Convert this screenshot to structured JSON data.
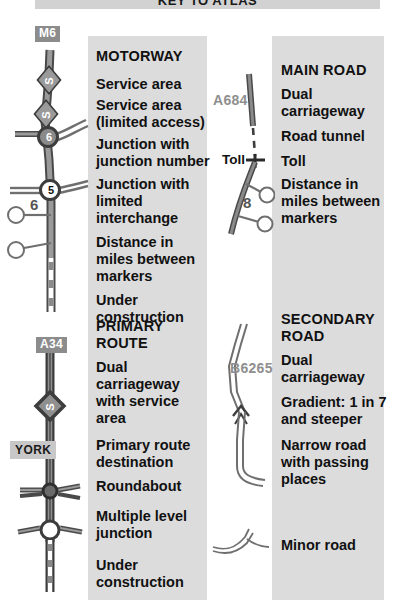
{
  "title": "KEY TO ATLAS",
  "colors": {
    "panel_bg": "#dcdcdc",
    "title_bg": "#d2d2d2",
    "road_dark": "#4a4a4a",
    "road_fill": "#9a9a9a",
    "shield_bg": "#8c8c8c",
    "place_bg": "#c8c8c8",
    "roadnum_text": "#8f8f8f",
    "text": "#111111"
  },
  "sections": {
    "motorway": {
      "heading": "MOTORWAY",
      "items": [
        "Service area",
        "Service area\n(limited access)",
        "Junction with\njunction number",
        "Junction with\nlimited\ninterchange",
        "Distance in\nmiles between\nmarkers",
        "Under\nconstruction"
      ],
      "symbol_labels": {
        "route_shield": "M6",
        "service_area": "S",
        "service_area_limited": "S",
        "junction_number": "6",
        "limited_junction_number": "5",
        "distance_miles": "6"
      }
    },
    "primary_route": {
      "heading": "PRIMARY\nROUTE",
      "items": [
        "Dual\ncarriageway\nwith service\narea",
        "Primary route\ndestination",
        "Roundabout",
        "Multiple level\njunction",
        "Under\nconstruction"
      ],
      "symbol_labels": {
        "route_shield": "A34",
        "service_area": "S",
        "destination": "YORK"
      }
    },
    "main_road": {
      "heading": "MAIN ROAD",
      "items": [
        "Dual\ncarriageway",
        "Road tunnel",
        "Toll",
        "Distance in\nmiles between\nmarkers"
      ],
      "symbol_labels": {
        "road_number": "A684",
        "toll_label": "Toll",
        "distance_miles": "8"
      }
    },
    "secondary_road": {
      "heading": "SECONDARY\nROAD",
      "items": [
        "Dual\ncarriageway",
        "Gradient: 1 in 7\nand steeper",
        "Narrow road\nwith passing\nplaces",
        "Minor road"
      ],
      "symbol_labels": {
        "road_number": "B6265"
      }
    }
  }
}
